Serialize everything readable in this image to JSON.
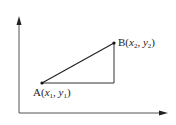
{
  "diagram": {
    "type": "coordinate-triangle",
    "colors": {
      "line": "#222222",
      "axis": "#444444",
      "background": "#ffffff"
    },
    "axes": {
      "origin": [
        19,
        113
      ],
      "y_axis_top": [
        19,
        17
      ],
      "x_axis_right": [
        167,
        113
      ]
    },
    "points": {
      "A": {
        "pos": [
          42,
          83
        ],
        "label_name": "A",
        "x_var": "x",
        "x_sub": "1",
        "y_var": "y",
        "y_sub": "1"
      },
      "B": {
        "pos": [
          114,
          43
        ],
        "label_name": "B",
        "x_var": "x",
        "x_sub": "2",
        "y_var": "y",
        "y_sub": "2"
      }
    },
    "right_angle_vertex": [
      114,
      83
    ]
  }
}
